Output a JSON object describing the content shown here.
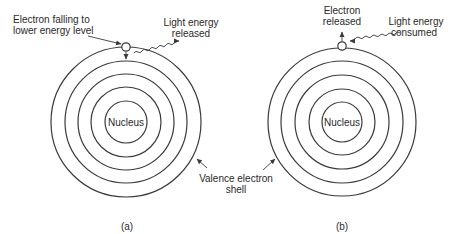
{
  "diagram": {
    "type": "atomic-shell-model",
    "colors": {
      "line": "#3a3a3a",
      "text": "#2a2a2a",
      "background": "#ffffff"
    },
    "panel_a": {
      "caption": "(a)",
      "nucleus_label": "Nucleus",
      "electron_label_line1": "Electron falling to",
      "electron_label_line2": "lower energy level",
      "light_label_line1": "Light energy",
      "light_label_line2": "released",
      "shell_count": 5
    },
    "panel_b": {
      "caption": "(b)",
      "nucleus_label": "Nucleus",
      "electron_label_line1": "Electron",
      "electron_label_line2": "released",
      "light_label_line1": "Light energy",
      "light_label_line2": "consumed",
      "shell_count": 5
    },
    "shared": {
      "valence_label_line1": "Valence electron",
      "valence_label_line2": "shell"
    }
  }
}
